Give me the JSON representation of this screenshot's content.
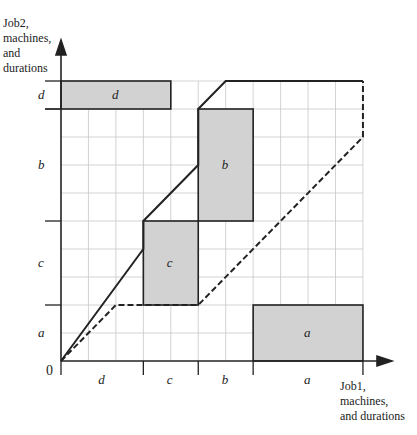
{
  "y_axis_label": [
    "Job2,",
    "machines,",
    "and",
    "durations"
  ],
  "x_axis_label": [
    "Job1,",
    "machines,",
    "and durations"
  ],
  "origin_label": "0",
  "job1_segments": [
    {
      "machine": "d",
      "duration": 3
    },
    {
      "machine": "c",
      "duration": 2
    },
    {
      "machine": "b",
      "duration": 2
    },
    {
      "machine": "a",
      "duration": 4
    }
  ],
  "job2_segments": [
    {
      "machine": "a",
      "duration": 2
    },
    {
      "machine": "c",
      "duration": 3
    },
    {
      "machine": "b",
      "duration": 4
    },
    {
      "machine": "d",
      "duration": 1
    }
  ],
  "obstacles": [
    {
      "label": "d",
      "x0": 0,
      "x1": 4,
      "y0": 9,
      "y1": 10
    },
    {
      "label": "b",
      "x0": 5,
      "x1": 7,
      "y0": 5,
      "y1": 9
    },
    {
      "label": "c",
      "x0": 3,
      "x1": 5,
      "y0": 2,
      "y1": 5
    },
    {
      "label": "a",
      "x0": 7,
      "x1": 11,
      "y0": 0,
      "y1": 2
    }
  ],
  "solid_path": [
    [
      0,
      0
    ],
    [
      3,
      4
    ],
    [
      3,
      5
    ],
    [
      5,
      7
    ],
    [
      5,
      9
    ],
    [
      6,
      10
    ],
    [
      11,
      10
    ]
  ],
  "dashed_path": [
    [
      0,
      0
    ],
    [
      2,
      2
    ],
    [
      5,
      2
    ],
    [
      11,
      8
    ],
    [
      11,
      10
    ]
  ],
  "colors": {
    "obstacle_fill": "#d2d2d2",
    "grid": "#c8c8c8",
    "line": "#222222"
  }
}
